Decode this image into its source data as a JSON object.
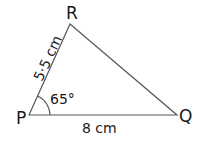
{
  "diagram": {
    "type": "triangle",
    "vertices": {
      "P": {
        "label": "P"
      },
      "Q": {
        "label": "Q"
      },
      "R": {
        "label": "R"
      }
    },
    "sides": {
      "PR": {
        "label": "5·5 cm"
      },
      "PQ": {
        "label": "8 cm"
      }
    },
    "angles": {
      "P": {
        "label": "65°"
      }
    },
    "line_color": "#555555"
  }
}
